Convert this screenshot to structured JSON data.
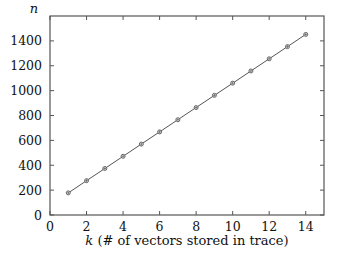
{
  "chart_data": {
    "type": "line",
    "title": "",
    "xlabel": "k (# of vectors stored in trace)",
    "xlabel_var": "k",
    "xlabel_rest": " (# of vectors stored in trace)",
    "ylabel": "n",
    "xlim": [
      0,
      15
    ],
    "ylim": [
      0,
      1600
    ],
    "xticks": [
      0,
      2,
      4,
      6,
      8,
      10,
      12,
      14
    ],
    "yticks": [
      0,
      200,
      400,
      600,
      800,
      1000,
      1200,
      1400
    ],
    "grid": false,
    "legend": null,
    "series": [
      {
        "name": "n",
        "marker": "circle-plus",
        "color": "#555555",
        "x": [
          1,
          2,
          3,
          4,
          5,
          6,
          7,
          8,
          9,
          10,
          11,
          12,
          13,
          14
        ],
        "values": [
          178,
          276,
          374,
          472,
          570,
          668,
          766,
          864,
          962,
          1060,
          1158,
          1256,
          1354,
          1452
        ]
      }
    ]
  }
}
